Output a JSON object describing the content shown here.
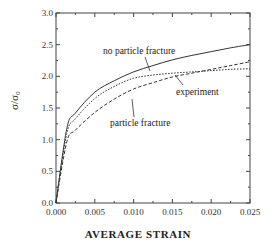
{
  "chart_data": {
    "type": "line",
    "title": "",
    "xlabel": "AVERAGE STRAIN",
    "ylabel": "σ/σ₀",
    "xlim": [
      0.0,
      0.025
    ],
    "ylim": [
      0.0,
      3.0
    ],
    "xticks": [
      "0.000",
      "0.005",
      "0.010",
      "0.015",
      "0.020",
      "0.025"
    ],
    "yticks": [
      "0.0",
      "0.5",
      "1.0",
      "1.5",
      "2.0",
      "2.5",
      "3.0"
    ],
    "grid": false,
    "legend": "inline annotations",
    "series": [
      {
        "name": "no particle fracture",
        "style": "solid",
        "x": [
          0.0,
          0.0014,
          0.0025,
          0.005,
          0.0075,
          0.01,
          0.0125,
          0.015,
          0.0175,
          0.02,
          0.0225,
          0.025
        ],
        "y": [
          0.0,
          1.18,
          1.42,
          1.75,
          1.93,
          2.07,
          2.17,
          2.26,
          2.33,
          2.39,
          2.45,
          2.5
        ]
      },
      {
        "name": "experiment",
        "style": "dotted",
        "x": [
          0.0,
          0.0014,
          0.0025,
          0.005,
          0.0075,
          0.01,
          0.0125,
          0.015,
          0.0175,
          0.02,
          0.0225,
          0.025
        ],
        "y": [
          0.0,
          1.1,
          1.33,
          1.65,
          1.84,
          1.97,
          2.02,
          2.05,
          2.07,
          2.09,
          2.11,
          2.12
        ]
      },
      {
        "name": "particle fracture",
        "style": "dashed",
        "x": [
          0.0,
          0.0014,
          0.0025,
          0.005,
          0.0075,
          0.01,
          0.0125,
          0.015,
          0.0175,
          0.02,
          0.0225,
          0.025
        ],
        "y": [
          0.0,
          0.97,
          1.15,
          1.43,
          1.64,
          1.8,
          1.9,
          1.99,
          2.05,
          2.11,
          2.17,
          2.23
        ]
      }
    ],
    "annotations": [
      {
        "text": "no particle fracture",
        "target": "no particle fracture"
      },
      {
        "text": "experiment",
        "target": "experiment"
      },
      {
        "text": "particle fracture",
        "target": "particle fracture"
      }
    ]
  }
}
